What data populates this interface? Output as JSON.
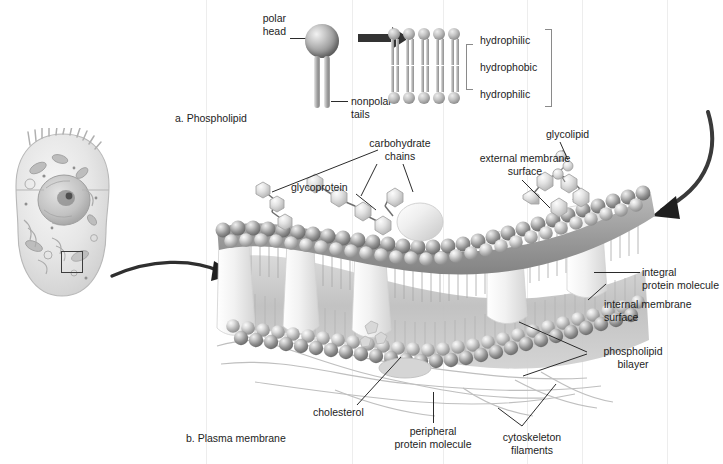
{
  "figure": {
    "background_color": "#ffffff",
    "ink_color": "#1d1d1d"
  },
  "panel_a": {
    "caption": "a. Phospholipid",
    "labels": {
      "polar_head": "polar\nhead",
      "nonpolar_tails": "nonpolar\ntails",
      "hydrophilic_top": "hydrophilic",
      "hydrophobic": "hydrophobic",
      "hydrophilic_bottom": "hydrophilic"
    },
    "arrow": "right-arrow-to-bilayer",
    "bilayer_columns": 5
  },
  "panel_b": {
    "caption": "b. Plasma membrane",
    "labels": {
      "carbohydrate_chains": "carbohydrate\nchains",
      "glycoprotein": "glycoprotein",
      "glycolipid": "glycolipid",
      "external_membrane_surface": "external membrane\nsurface",
      "integral_protein_molecule": "integral\nprotein molecule",
      "internal_membrane_surface": "internal membrane\nsurface",
      "phospholipid_bilayer": "phospholipid\nbilayer",
      "cholesterol": "cholesterol",
      "peripheral_protein_molecule": "peripheral\nprotein molecule",
      "cytoskeleton_filaments": "cytoskeleton\nfilaments"
    }
  },
  "cell_inset": {
    "name": "animal-cell-illustration",
    "zoom_region": "membrane-detail-box",
    "arrow": "curved-arrow-to-membrane"
  },
  "colors": {
    "head_light": "#ededed",
    "head_mid": "#9a9a9a",
    "head_dark": "#5e5e5e",
    "tail": "#b2b2b2",
    "outline": "#2b2b2b",
    "band": "#ededed"
  }
}
